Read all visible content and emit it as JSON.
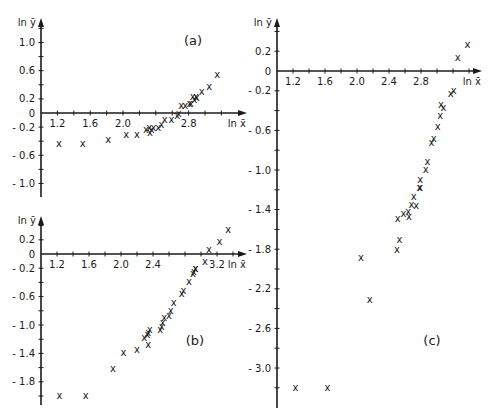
{
  "figure": {
    "background": "#ffffff",
    "ink_color": "#1a1a1a",
    "marker_glyph": "x"
  },
  "chart_data": [
    {
      "panel": "(a)",
      "type": "scatter",
      "xlabel": "ln x̄",
      "ylabel": "ln ȳ",
      "x_ticks": [
        "1.2",
        "1.6",
        "2.0",
        "2.8"
      ],
      "x_tick_values": [
        1.2,
        1.6,
        2.0,
        2.8
      ],
      "y_ticks": [
        "1.0",
        "0.6",
        "0.2",
        "0",
        "-0.2",
        "-0.6",
        "-1.0"
      ],
      "y_tick_values": [
        1.0,
        0.6,
        0.2,
        0,
        -0.2,
        -0.6,
        -1.0
      ],
      "xlim": [
        1.0,
        3.35
      ],
      "ylim": [
        -1.25,
        1.3
      ],
      "grid": false,
      "layout": {
        "origin_px": [
          41,
          113
        ],
        "px_per_x": 82,
        "px_per_y": 70.5,
        "x_axis_end_px": 247,
        "y_axis_top_px": 18,
        "y_axis_bottom_px": 197,
        "label_px": [
          193,
          45
        ]
      },
      "points": [
        [
          1.22,
          -0.43
        ],
        [
          1.51,
          -0.43
        ],
        [
          1.82,
          -0.37
        ],
        [
          2.04,
          -0.31
        ],
        [
          2.17,
          -0.31
        ],
        [
          2.28,
          -0.23
        ],
        [
          2.33,
          -0.28
        ],
        [
          2.32,
          -0.2
        ],
        [
          2.37,
          -0.21
        ],
        [
          2.35,
          -0.24
        ],
        [
          2.43,
          -0.2
        ],
        [
          2.47,
          -0.16
        ],
        [
          2.51,
          -0.09
        ],
        [
          2.59,
          -0.09
        ],
        [
          2.66,
          -0.03
        ],
        [
          2.68,
          0.0
        ],
        [
          2.71,
          0.1
        ],
        [
          2.76,
          0.1
        ],
        [
          2.81,
          0.13
        ],
        [
          2.83,
          0.14
        ],
        [
          2.87,
          0.19
        ],
        [
          2.89,
          0.24
        ],
        [
          2.85,
          0.24
        ],
        [
          2.9,
          0.22
        ],
        [
          2.96,
          0.31
        ],
        [
          3.05,
          0.37
        ],
        [
          3.15,
          0.54
        ]
      ]
    },
    {
      "panel": "(b)",
      "type": "scatter",
      "xlabel": "ln x̄",
      "ylabel": "ln ȳ",
      "x_ticks": [
        "1.2",
        "1.6",
        "2.0",
        "2.4",
        "3.2"
      ],
      "x_tick_values": [
        1.2,
        1.6,
        2.0,
        2.4,
        3.2
      ],
      "y_ticks": [
        "0.2",
        "0",
        "-0.2",
        "-0.6",
        "-1.0",
        "-1.4",
        "-1.8"
      ],
      "y_tick_values": [
        0.2,
        0,
        -0.2,
        -0.6,
        -1.0,
        -1.4,
        -1.8
      ],
      "xlim": [
        1.0,
        3.4
      ],
      "ylim": [
        -2.1,
        0.4
      ],
      "grid": false,
      "layout": {
        "origin_px": [
          41,
          254
        ],
        "px_per_x": 80,
        "px_per_y": 71,
        "x_axis_end_px": 247,
        "y_axis_top_px": 216,
        "y_axis_bottom_px": 405,
        "label_px": [
          195,
          345
        ]
      },
      "points": [
        [
          1.23,
          -1.99
        ],
        [
          1.56,
          -1.99
        ],
        [
          1.9,
          -1.61
        ],
        [
          2.03,
          -1.39
        ],
        [
          2.2,
          -1.34
        ],
        [
          2.29,
          -1.17
        ],
        [
          2.33,
          -1.13
        ],
        [
          2.34,
          -1.1
        ],
        [
          2.34,
          -1.27
        ],
        [
          2.36,
          -1.07
        ],
        [
          2.49,
          -1.07
        ],
        [
          2.51,
          -1.02
        ],
        [
          2.52,
          -0.96
        ],
        [
          2.54,
          -0.9
        ],
        [
          2.6,
          -0.86
        ],
        [
          2.62,
          -0.8
        ],
        [
          2.66,
          -0.69
        ],
        [
          2.76,
          -0.55
        ],
        [
          2.78,
          -0.52
        ],
        [
          2.85,
          -0.39
        ],
        [
          2.9,
          -0.27
        ],
        [
          2.91,
          -0.24
        ],
        [
          2.93,
          -0.21
        ],
        [
          2.93,
          -0.21
        ],
        [
          3.05,
          -0.11
        ],
        [
          3.1,
          0.06
        ],
        [
          3.23,
          0.18
        ],
        [
          3.34,
          0.35
        ]
      ]
    },
    {
      "panel": "(c)",
      "type": "scatter",
      "xlabel": "ln x̄",
      "ylabel": "ln ȳ",
      "x_ticks": [
        "1.2",
        "1.6",
        "2.0",
        "2.4",
        "2.8"
      ],
      "x_tick_values": [
        1.2,
        1.6,
        2.0,
        2.4,
        2.8
      ],
      "y_ticks": [
        "0.2",
        "0",
        "-0.2",
        "-0.6",
        "-1.0",
        "-1.4",
        "-1.8",
        "-2.2",
        "-2.6",
        "-3.0"
      ],
      "y_tick_values": [
        0.2,
        0,
        -0.2,
        -0.6,
        -1.0,
        -1.4,
        -1.8,
        -2.2,
        -2.6,
        -3.0
      ],
      "xlim": [
        1.0,
        3.5
      ],
      "ylim": [
        -3.4,
        0.5
      ],
      "grid": false,
      "layout": {
        "origin_px": [
          277,
          71
        ],
        "px_per_x": 80,
        "px_per_y": 99,
        "x_axis_end_px": 482,
        "y_axis_top_px": 18,
        "y_axis_bottom_px": 408,
        "label_px": [
          432,
          345
        ]
      },
      "points": [
        [
          1.23,
          -3.2
        ],
        [
          1.63,
          -3.2
        ],
        [
          2.16,
          -2.31
        ],
        [
          2.05,
          -1.88
        ],
        [
          2.5,
          -1.8
        ],
        [
          2.53,
          -1.7
        ],
        [
          2.51,
          -1.49
        ],
        [
          2.58,
          -1.44
        ],
        [
          2.65,
          -1.47
        ],
        [
          2.64,
          -1.42
        ],
        [
          2.74,
          -1.36
        ],
        [
          2.68,
          -1.35
        ],
        [
          2.71,
          -1.27
        ],
        [
          2.78,
          -1.18
        ],
        [
          2.79,
          -1.1
        ],
        [
          2.86,
          -0.99
        ],
        [
          2.88,
          -0.91
        ],
        [
          2.79,
          -1.18
        ],
        [
          2.93,
          -0.72
        ],
        [
          2.96,
          -0.68
        ],
        [
          3.01,
          -0.56
        ],
        [
          3.04,
          -0.45
        ],
        [
          3.05,
          -0.34
        ],
        [
          3.08,
          -0.37
        ],
        [
          3.17,
          -0.23
        ],
        [
          3.21,
          -0.2
        ],
        [
          3.26,
          0.14
        ],
        [
          3.38,
          0.27
        ]
      ]
    }
  ]
}
